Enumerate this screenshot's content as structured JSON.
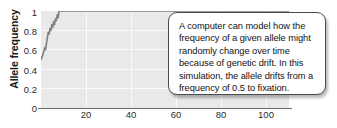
{
  "chart_data": {
    "type": "line",
    "title": "",
    "xlabel": "",
    "ylabel": "Allele frequency",
    "xlim": [
      0,
      110
    ],
    "ylim": [
      0,
      1
    ],
    "grid": true,
    "legend": "none",
    "x_ticks": [
      20,
      40,
      60,
      80,
      100
    ],
    "y_ticks": [
      "1",
      "0.8",
      "0.6",
      "0.4",
      "0.2",
      "0"
    ],
    "y_tick_values": [
      1,
      0.8,
      0.6,
      0.4,
      0.2,
      0
    ],
    "series": [
      {
        "name": "allele frequency",
        "color": "#808080",
        "x": [
          0,
          0.4,
          0.8,
          1.2,
          1.6,
          2.0,
          2.4,
          2.8,
          3.2,
          3.6,
          4.0,
          4.4,
          4.8,
          5.2,
          5.6,
          6.0,
          6.4,
          6.8,
          7.2,
          7.6,
          8.0,
          110
        ],
        "values": [
          0.5,
          0.52,
          0.55,
          0.58,
          0.62,
          0.6,
          0.66,
          0.72,
          0.78,
          0.76,
          0.82,
          0.8,
          0.86,
          0.83,
          0.89,
          0.86,
          0.92,
          0.9,
          0.96,
          0.93,
          1.0,
          1.0
        ]
      }
    ]
  },
  "axis": {
    "y_title": "Allele frequency",
    "y_tick_labels": [
      "1",
      "0.8",
      "0.6",
      "0.4",
      "0.2",
      "0"
    ],
    "x_tick_labels": [
      "20",
      "40",
      "60",
      "80",
      "100"
    ]
  },
  "callout": {
    "text": "A computer can model how the frequency of a given allele might randomly change over time because of genetic drift. In this simulation, the allele drifts from a frequency of 0.5 to fixation."
  },
  "colors": {
    "plot_background": "#e9e9e9",
    "gridline": "#fafafa",
    "axis_line": "#6e6e6e",
    "data_line": "#808080",
    "callout_border": "#4a4a4a",
    "text": "#111111"
  }
}
